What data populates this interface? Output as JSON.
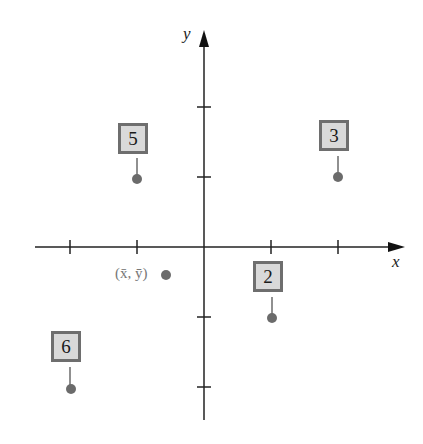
{
  "diagram": {
    "axes": {
      "x_label": "x",
      "y_label": "y",
      "origin_px": [
        203,
        247
      ],
      "tick_spacing_px": 67,
      "x_ticks": [
        -2,
        -1,
        1,
        2
      ],
      "y_ticks": [
        -2,
        -1,
        1,
        2
      ]
    },
    "points": [
      {
        "label": "5",
        "x": -1,
        "y": 1
      },
      {
        "label": "3",
        "x": 2,
        "y": 1
      },
      {
        "label": "2",
        "x": 1,
        "y": -1
      },
      {
        "label": "6",
        "x": -2,
        "y": -2
      }
    ],
    "mean_point": {
      "label": "(x̄, ȳ)",
      "x": -0.55,
      "y": -0.4
    },
    "colors": {
      "axis": "#222222",
      "point": "#6b6b6b",
      "box_fill": "#d9d9d9",
      "box_border": "#6e6e6e",
      "mean_label": "#777777"
    }
  }
}
